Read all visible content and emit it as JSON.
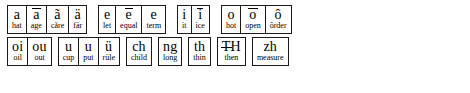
{
  "document": {
    "title": "Pronunciation Key",
    "text_color": "#000000",
    "background_color": "#ffffff",
    "border_color": "#1a1a1a"
  },
  "rows": [
    {
      "row_id": "row-1",
      "groups": [
        {
          "group_id": "group-a",
          "cells": [
            {
              "symbol": "a",
              "example": "hat",
              "mark": "none"
            },
            {
              "symbol": "a",
              "example": "age",
              "mark": "macron"
            },
            {
              "symbol": "ã",
              "example": "cãre",
              "mark": "tilde"
            },
            {
              "symbol": "ä",
              "example": "fär",
              "mark": "diaeresis"
            }
          ]
        },
        {
          "group_id": "group-e",
          "cells": [
            {
              "symbol": "e",
              "example": "let",
              "mark": "none"
            },
            {
              "symbol": "e",
              "example": "equal",
              "mark": "macron"
            },
            {
              "symbol": "e",
              "example": "term",
              "mark": "none"
            }
          ]
        },
        {
          "group_id": "group-i",
          "cells": [
            {
              "symbol": "i",
              "example": "it",
              "mark": "none"
            },
            {
              "symbol": "i",
              "example": "ice",
              "mark": "macron"
            }
          ]
        },
        {
          "group_id": "group-o",
          "cells": [
            {
              "symbol": "o",
              "example": "hot",
              "mark": "none"
            },
            {
              "symbol": "o",
              "example": "open",
              "mark": "macron"
            },
            {
              "symbol": "ô",
              "example": "ôrder",
              "mark": "circumflex"
            }
          ]
        }
      ]
    },
    {
      "row_id": "row-2",
      "groups": [
        {
          "group_id": "group-diphthong",
          "cells": [
            {
              "symbol": "oi",
              "example": "oil",
              "mark": "none"
            },
            {
              "symbol": "ou",
              "example": "out",
              "mark": "none"
            }
          ]
        },
        {
          "group_id": "group-u",
          "cells": [
            {
              "symbol": "u",
              "example": "cup",
              "mark": "none"
            },
            {
              "symbol": "u",
              "example": "put",
              "mark": "none"
            },
            {
              "symbol": "ü",
              "example": "rüle",
              "mark": "diaeresis"
            }
          ]
        },
        {
          "group_id": "group-ch",
          "cells": [
            {
              "symbol": "ch",
              "example": "child",
              "mark": "none"
            }
          ]
        },
        {
          "group_id": "group-ng",
          "cells": [
            {
              "symbol": "ng",
              "example": "long",
              "mark": "none"
            }
          ]
        },
        {
          "group_id": "group-th",
          "cells": [
            {
              "symbol": "th",
              "example": "thin",
              "mark": "none"
            }
          ]
        },
        {
          "group_id": "group-eth",
          "cells": [
            {
              "symbol": "H",
              "example": "then",
              "mark": "barred-t"
            }
          ]
        },
        {
          "group_id": "group-zh",
          "cells": [
            {
              "symbol": "zh",
              "example": "measure",
              "mark": "none"
            }
          ]
        }
      ]
    }
  ]
}
